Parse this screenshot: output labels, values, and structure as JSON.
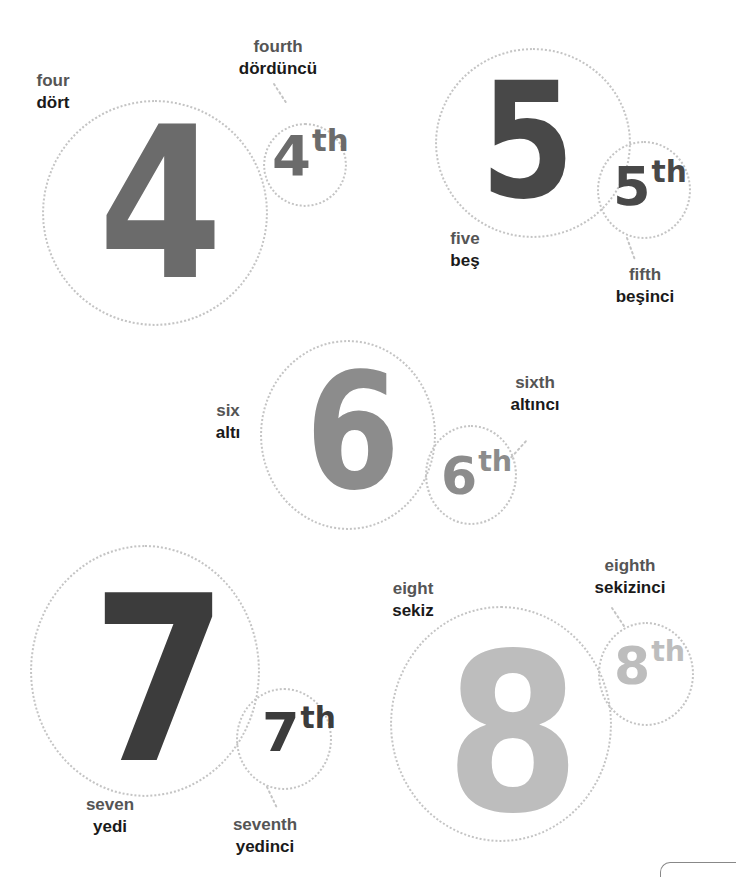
{
  "numbers": [
    {
      "digit": "4",
      "suffix": "th",
      "en": "four",
      "tr": "dört",
      "ord_en": "fourth",
      "ord_tr": "dördüncü",
      "color": "#6b6b6b"
    },
    {
      "digit": "5",
      "suffix": "th",
      "en": "five",
      "tr": "beş",
      "ord_en": "fifth",
      "ord_tr": "beşinci",
      "color": "#484848"
    },
    {
      "digit": "6",
      "suffix": "th",
      "en": "six",
      "tr": "altı",
      "ord_en": "sixth",
      "ord_tr": "altıncı",
      "color": "#8c8c8c"
    },
    {
      "digit": "7",
      "suffix": "th",
      "en": "seven",
      "tr": "yedi",
      "ord_en": "seventh",
      "ord_tr": "yedinci",
      "color": "#3c3c3c"
    },
    {
      "digit": "8",
      "suffix": "th",
      "en": "eight",
      "tr": "sekiz",
      "ord_en": "eighth",
      "ord_tr": "sekizinci",
      "color": "#bdbdbd"
    }
  ],
  "colors": {
    "circle_dots": "#c4c4c4",
    "label_en": "#555555",
    "label_tr": "#1a1a1a"
  }
}
